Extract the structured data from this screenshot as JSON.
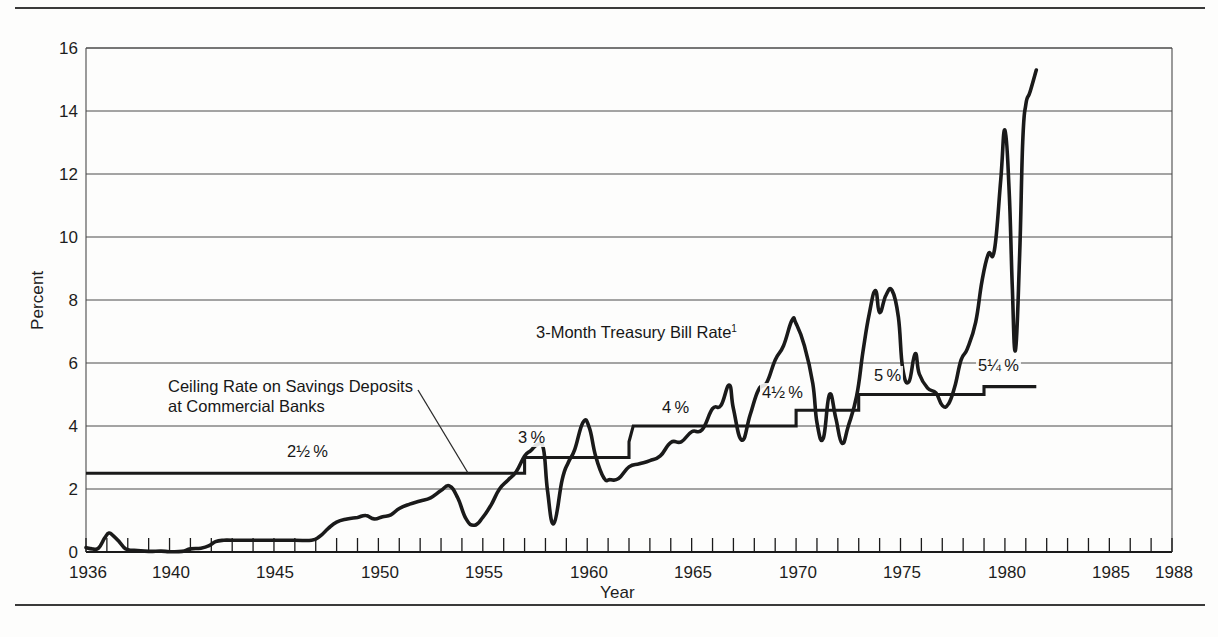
{
  "figure": {
    "background_color": "#fdfdfc",
    "line_color": "#1a1a1a",
    "grid_color": "#555555"
  },
  "axes": {
    "ylabel": "Percent",
    "xlabel": "Year",
    "yticks": [
      "0",
      "2",
      "4",
      "6",
      "8",
      "10",
      "12",
      "14",
      "16"
    ],
    "xticks": [
      "1936",
      "1940",
      "1945",
      "1950",
      "1955",
      "1960",
      "1965",
      "1970",
      "1975",
      "1980",
      "1985",
      "1988"
    ]
  },
  "annotations": {
    "tbill_label": "3-Month Treasury Bill Rate",
    "tbill_footnote": "1",
    "ceiling_label_line1": "Ceiling Rate on Savings Deposits",
    "ceiling_label_line2": "at Commercial Banks",
    "steps": [
      {
        "text": "2½ %",
        "x": 285,
        "y": 450
      },
      {
        "text": "3 %",
        "x": 516,
        "y": 434
      },
      {
        "text": "4 %",
        "x": 663,
        "y": 405
      },
      {
        "text": "4½ %",
        "x": 764,
        "y": 390
      },
      {
        "text": "5 %",
        "x": 877,
        "y": 372
      },
      {
        "text": "5¼ %",
        "x": 982,
        "y": 363
      }
    ]
  },
  "chart_data": {
    "type": "line",
    "title": "",
    "xlabel": "Year",
    "ylabel": "Percent",
    "xlim": [
      1936,
      1988
    ],
    "ylim": [
      0,
      16
    ],
    "grid": "horizontal",
    "legend": "inline-annotations",
    "series": [
      {
        "name": "3-Month Treasury Bill Rate",
        "points": [
          [
            1936.0,
            0.14
          ],
          [
            1936.3,
            0.1
          ],
          [
            1936.6,
            0.12
          ],
          [
            1936.9,
            0.45
          ],
          [
            1937.1,
            0.6
          ],
          [
            1937.3,
            0.52
          ],
          [
            1937.6,
            0.32
          ],
          [
            1937.9,
            0.1
          ],
          [
            1938.3,
            0.05
          ],
          [
            1939.0,
            0.02
          ],
          [
            1939.6,
            0.03
          ],
          [
            1940.0,
            0.01
          ],
          [
            1940.6,
            0.02
          ],
          [
            1941.0,
            0.1
          ],
          [
            1941.5,
            0.12
          ],
          [
            1941.9,
            0.2
          ],
          [
            1942.2,
            0.33
          ],
          [
            1942.6,
            0.375
          ],
          [
            1943.0,
            0.375
          ],
          [
            1944.0,
            0.375
          ],
          [
            1945.0,
            0.375
          ],
          [
            1946.0,
            0.375
          ],
          [
            1946.8,
            0.375
          ],
          [
            1947.2,
            0.5
          ],
          [
            1947.6,
            0.75
          ],
          [
            1948.0,
            0.95
          ],
          [
            1948.5,
            1.05
          ],
          [
            1949.0,
            1.1
          ],
          [
            1949.4,
            1.16
          ],
          [
            1949.8,
            1.05
          ],
          [
            1950.2,
            1.12
          ],
          [
            1950.6,
            1.18
          ],
          [
            1951.0,
            1.38
          ],
          [
            1951.5,
            1.52
          ],
          [
            1952.0,
            1.62
          ],
          [
            1952.5,
            1.72
          ],
          [
            1953.0,
            1.95
          ],
          [
            1953.4,
            2.1
          ],
          [
            1953.8,
            1.72
          ],
          [
            1954.2,
            1.05
          ],
          [
            1954.6,
            0.85
          ],
          [
            1955.0,
            1.1
          ],
          [
            1955.4,
            1.5
          ],
          [
            1955.8,
            2.0
          ],
          [
            1956.2,
            2.28
          ],
          [
            1956.6,
            2.55
          ],
          [
            1957.0,
            3.05
          ],
          [
            1957.3,
            3.22
          ],
          [
            1957.6,
            3.4
          ],
          [
            1957.9,
            3.28
          ],
          [
            1958.1,
            1.95
          ],
          [
            1958.4,
            0.9
          ],
          [
            1958.8,
            2.3
          ],
          [
            1959.1,
            2.85
          ],
          [
            1959.4,
            3.25
          ],
          [
            1959.8,
            4.12
          ],
          [
            1960.1,
            3.95
          ],
          [
            1960.4,
            3.05
          ],
          [
            1960.8,
            2.35
          ],
          [
            1961.1,
            2.3
          ],
          [
            1961.5,
            2.33
          ],
          [
            1962.0,
            2.7
          ],
          [
            1962.5,
            2.8
          ],
          [
            1963.0,
            2.9
          ],
          [
            1963.5,
            3.05
          ],
          [
            1964.0,
            3.48
          ],
          [
            1964.5,
            3.5
          ],
          [
            1965.0,
            3.82
          ],
          [
            1965.5,
            3.88
          ],
          [
            1966.0,
            4.55
          ],
          [
            1966.4,
            4.65
          ],
          [
            1966.8,
            5.3
          ],
          [
            1967.0,
            4.55
          ],
          [
            1967.4,
            3.55
          ],
          [
            1967.8,
            4.35
          ],
          [
            1968.2,
            5.15
          ],
          [
            1968.6,
            5.38
          ],
          [
            1969.0,
            6.1
          ],
          [
            1969.4,
            6.55
          ],
          [
            1969.8,
            7.35
          ],
          [
            1970.0,
            7.25
          ],
          [
            1970.4,
            6.55
          ],
          [
            1970.8,
            5.35
          ],
          [
            1971.0,
            4.1
          ],
          [
            1971.3,
            3.6
          ],
          [
            1971.6,
            5.0
          ],
          [
            1971.9,
            4.25
          ],
          [
            1972.2,
            3.45
          ],
          [
            1972.5,
            4.0
          ],
          [
            1972.9,
            4.95
          ],
          [
            1973.2,
            6.35
          ],
          [
            1973.5,
            7.55
          ],
          [
            1973.8,
            8.3
          ],
          [
            1974.0,
            7.6
          ],
          [
            1974.3,
            8.15
          ],
          [
            1974.6,
            8.3
          ],
          [
            1974.9,
            7.45
          ],
          [
            1975.1,
            5.85
          ],
          [
            1975.4,
            5.4
          ],
          [
            1975.7,
            6.3
          ],
          [
            1975.9,
            5.65
          ],
          [
            1976.3,
            5.2
          ],
          [
            1976.7,
            5.05
          ],
          [
            1977.0,
            4.65
          ],
          [
            1977.3,
            4.7
          ],
          [
            1977.6,
            5.25
          ],
          [
            1977.9,
            6.1
          ],
          [
            1978.2,
            6.45
          ],
          [
            1978.6,
            7.3
          ],
          [
            1978.9,
            8.6
          ],
          [
            1979.2,
            9.45
          ],
          [
            1979.5,
            9.6
          ],
          [
            1979.8,
            11.8
          ],
          [
            1980.0,
            13.4
          ],
          [
            1980.2,
            11.5
          ],
          [
            1980.35,
            8.5
          ],
          [
            1980.5,
            6.4
          ],
          [
            1980.7,
            9.3
          ],
          [
            1980.85,
            13.0
          ],
          [
            1981.0,
            14.2
          ],
          [
            1981.2,
            14.6
          ],
          [
            1981.5,
            15.3
          ]
        ]
      },
      {
        "name": "Ceiling Rate on Savings Deposits at Commercial Banks",
        "step_points": [
          [
            1936.0,
            2.5
          ],
          [
            1957.0,
            2.5
          ],
          [
            1957.0,
            3.0
          ],
          [
            1962.0,
            3.0
          ],
          [
            1962.0,
            3.5
          ],
          [
            1962.0,
            3.5
          ],
          [
            1962.2,
            4.0
          ],
          [
            1970.0,
            4.0
          ],
          [
            1970.0,
            4.5
          ],
          [
            1973.0,
            4.5
          ],
          [
            1973.0,
            5.0
          ],
          [
            1979.0,
            5.0
          ],
          [
            1979.0,
            5.25
          ],
          [
            1981.5,
            5.25
          ]
        ]
      }
    ]
  }
}
